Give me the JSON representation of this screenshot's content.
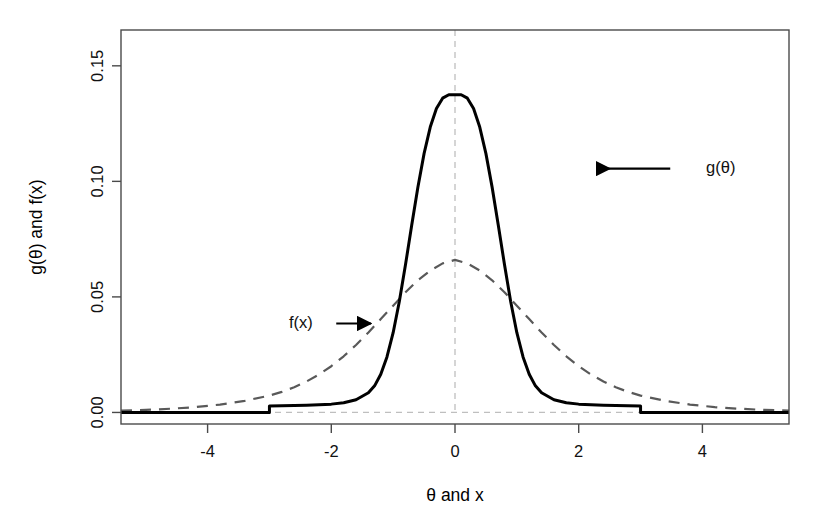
{
  "chart_data": {
    "type": "line",
    "title": "",
    "subtitle": "",
    "xlabel": "θ and x",
    "ylabel": "g(θ) and f(x)",
    "xlim": [
      -5.4,
      5.4
    ],
    "ylim": [
      -0.005,
      0.1655
    ],
    "xticks": [
      -4,
      -2,
      0,
      2,
      4
    ],
    "xticklabels": [
      "-4",
      "-2",
      "0",
      "2",
      "4"
    ],
    "yticks": [
      0.0,
      0.05,
      0.1,
      0.15
    ],
    "yticklabels": [
      "0.00",
      "0.05",
      "0.10",
      "0.15"
    ],
    "grid": false,
    "reference_lines": [
      {
        "name": "zero-horizontal",
        "orientation": "horizontal",
        "value": 0.0,
        "style": "dashed",
        "color": "#bfbfbf"
      },
      {
        "name": "zero-vertical",
        "orientation": "vertical",
        "value": 0.0,
        "style": "dashed",
        "color": "#bfbfbf"
      }
    ],
    "legend": {
      "position": "inline-annotations",
      "entries": [
        "g(θ)",
        "f(x)"
      ]
    },
    "annotations": [
      {
        "name": "g-theta-annotation",
        "text": "g(θ)",
        "text_x": 4.06,
        "text_y": 0.1055,
        "arrow_from_x": 3.48,
        "arrow_from_y": 0.1055,
        "arrow_to_x": 2.3,
        "arrow_to_y": 0.1055,
        "arrow_direction": "left"
      },
      {
        "name": "f-x-annotation",
        "text": "f(x)",
        "text_x": -2.3,
        "text_y": 0.0385,
        "arrow_from_x": -1.92,
        "arrow_from_y": 0.0385,
        "arrow_to_x": -1.36,
        "arrow_to_y": 0.0385,
        "arrow_direction": "right"
      }
    ],
    "series": [
      {
        "name": "g(θ)",
        "label": "g(θ)",
        "style": "solid",
        "color": "#000000",
        "linewidth": 3.0,
        "description": "truncated peaked density supported on [-3, 3], peak 0.1375 at 0",
        "support": [
          -3,
          3
        ],
        "peak_x": 0,
        "peak_y": 0.1375,
        "x": [
          -5.4,
          -3.0,
          -3.0,
          -2.8,
          -2.6,
          -2.4,
          -2.2,
          -2.0,
          -1.8,
          -1.6,
          -1.4,
          -1.3,
          -1.2,
          -1.1,
          -1.0,
          -0.9,
          -0.8,
          -0.7,
          -0.6,
          -0.5,
          -0.4,
          -0.3,
          -0.2,
          -0.1,
          0.0,
          0.1,
          0.2,
          0.3,
          0.4,
          0.5,
          0.6,
          0.7,
          0.8,
          0.9,
          1.0,
          1.1,
          1.2,
          1.3,
          1.4,
          1.6,
          1.8,
          2.0,
          2.2,
          2.4,
          2.6,
          2.8,
          3.0,
          3.0,
          5.4
        ],
        "y": [
          0.0,
          0.0,
          0.0028,
          0.0029,
          0.003,
          0.0031,
          0.0033,
          0.0036,
          0.0042,
          0.0055,
          0.0085,
          0.0115,
          0.0165,
          0.024,
          0.0345,
          0.048,
          0.064,
          0.081,
          0.0975,
          0.112,
          0.1235,
          0.1315,
          0.136,
          0.1375,
          0.1375,
          0.1375,
          0.136,
          0.1315,
          0.1235,
          0.112,
          0.0975,
          0.081,
          0.064,
          0.048,
          0.0345,
          0.024,
          0.0165,
          0.0115,
          0.0085,
          0.0055,
          0.0042,
          0.0036,
          0.0033,
          0.0031,
          0.003,
          0.0029,
          0.0028,
          0.0,
          0.0
        ]
      },
      {
        "name": "f(x)",
        "label": "f(x)",
        "style": "dashed",
        "color": "#595959",
        "linewidth": 2.2,
        "description": "broad bell-shaped density, peak 0.0660 at 0, long tails to ±5.4",
        "support": [
          -5.4,
          5.4
        ],
        "peak_x": 0,
        "peak_y": 0.066,
        "x": [
          -5.4,
          -5.0,
          -4.6,
          -4.2,
          -3.8,
          -3.4,
          -3.0,
          -2.8,
          -2.6,
          -2.4,
          -2.2,
          -2.0,
          -1.8,
          -1.6,
          -1.4,
          -1.2,
          -1.0,
          -0.8,
          -0.6,
          -0.4,
          -0.2,
          0.0,
          0.2,
          0.4,
          0.6,
          0.8,
          1.0,
          1.2,
          1.4,
          1.6,
          1.8,
          2.0,
          2.2,
          2.4,
          2.6,
          2.8,
          3.0,
          3.4,
          3.8,
          4.2,
          4.6,
          5.0,
          5.4
        ],
        "y": [
          0.0008,
          0.0011,
          0.0016,
          0.0023,
          0.0034,
          0.005,
          0.0073,
          0.0089,
          0.0109,
          0.0134,
          0.0164,
          0.02,
          0.0243,
          0.0292,
          0.0346,
          0.0404,
          0.0462,
          0.052,
          0.0572,
          0.0614,
          0.0645,
          0.066,
          0.0645,
          0.0614,
          0.0572,
          0.052,
          0.0462,
          0.0404,
          0.0346,
          0.0292,
          0.0243,
          0.02,
          0.0164,
          0.0134,
          0.0109,
          0.0089,
          0.0073,
          0.005,
          0.0034,
          0.0023,
          0.0016,
          0.0011,
          0.0008
        ]
      }
    ]
  }
}
